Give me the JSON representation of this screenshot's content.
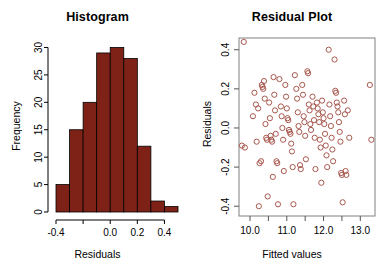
{
  "figure": {
    "background": "#ffffff",
    "panels": [
      "histogram",
      "residual-plot"
    ]
  },
  "histogram": {
    "title": "Histogram",
    "xlabel": "Residuals",
    "ylabel": "Frequency",
    "bar_fill": "#7E2217",
    "bar_border": "#000000",
    "axis_color": "#000000",
    "x_tick_labels": [
      "-0.4",
      "",
      "0.0",
      "0.2",
      "0.4"
    ],
    "x_tick_values": [
      -0.4,
      -0.2,
      0.0,
      0.2,
      0.4
    ],
    "y_tick_labels": [
      "0",
      "5",
      "10",
      "15",
      "20",
      "25",
      "30"
    ],
    "y_tick_values": [
      0,
      5,
      10,
      15,
      20,
      25,
      30
    ]
  },
  "residual_plot": {
    "title": "Residual Plot",
    "xlabel": "Fitted values",
    "ylabel": "Residuals",
    "point_color": "#A8584E",
    "box_color": "#808080",
    "axis_color": "#555555",
    "x_tick_labels": [
      "10.0",
      "",
      "11.0",
      "",
      "12.0",
      "",
      "13.0"
    ],
    "x_tick_values": [
      10.0,
      10.5,
      11.0,
      11.5,
      12.0,
      12.5,
      13.0
    ],
    "y_tick_labels": [
      "-0.4",
      "-0.2",
      "0.0",
      "0.2",
      "0.4"
    ],
    "y_tick_values": [
      -0.4,
      -0.2,
      0.0,
      0.2,
      0.4
    ]
  },
  "chart_data": [
    {
      "type": "bar",
      "id": "histogram",
      "title": "Histogram",
      "xlabel": "Residuals",
      "ylabel": "Frequency",
      "xlim": [
        -0.4,
        0.5
      ],
      "ylim": [
        0,
        31
      ],
      "grid": false,
      "legend": null,
      "bin_width": 0.1,
      "bin_edges": [
        -0.4,
        -0.3,
        -0.2,
        -0.1,
        0.0,
        0.1,
        0.2,
        0.3,
        0.4,
        0.5
      ],
      "categories": [
        "-0.4 to -0.3",
        "-0.3 to -0.2",
        "-0.2 to -0.1",
        "-0.1 to 0.0",
        "0.0 to 0.1",
        "0.1 to 0.2",
        "0.2 to 0.3",
        "0.3 to 0.4",
        "0.4 to 0.5"
      ],
      "values": [
        5,
        15,
        20,
        29,
        30,
        28,
        12,
        2,
        1
      ],
      "color": "#7E2217"
    },
    {
      "type": "scatter",
      "id": "residual-plot",
      "title": "Residual Plot",
      "xlabel": "Fitted values",
      "ylabel": "Residuals",
      "xlim": [
        9.7,
        13.4
      ],
      "ylim": [
        -0.45,
        0.46
      ],
      "grid": false,
      "legend": null,
      "marker": "open-circle",
      "color": "#A8584E",
      "points": [
        [
          9.83,
          0.44
        ],
        [
          9.78,
          -0.09
        ],
        [
          9.86,
          -0.1
        ],
        [
          10.08,
          0.06
        ],
        [
          10.12,
          0.18
        ],
        [
          10.16,
          0.12
        ],
        [
          10.18,
          -0.07
        ],
        [
          10.22,
          0.1
        ],
        [
          10.24,
          -0.4
        ],
        [
          10.26,
          -0.18
        ],
        [
          10.3,
          -0.17
        ],
        [
          10.32,
          0.22
        ],
        [
          10.34,
          0.21
        ],
        [
          10.36,
          0.2
        ],
        [
          10.38,
          0.24
        ],
        [
          10.4,
          0.15
        ],
        [
          10.42,
          0.02
        ],
        [
          10.44,
          -0.05
        ],
        [
          10.46,
          -0.06
        ],
        [
          10.48,
          -0.35
        ],
        [
          10.52,
          0.13
        ],
        [
          10.54,
          0.05
        ],
        [
          10.56,
          -0.04
        ],
        [
          10.58,
          -0.06
        ],
        [
          10.6,
          -0.07
        ],
        [
          10.62,
          -0.25
        ],
        [
          10.64,
          0.26
        ],
        [
          10.66,
          0.17
        ],
        [
          10.68,
          0.09
        ],
        [
          10.7,
          -0.03
        ],
        [
          10.72,
          -0.17
        ],
        [
          10.74,
          -0.18
        ],
        [
          10.76,
          -0.39
        ],
        [
          10.8,
          0.25
        ],
        [
          10.84,
          0.11
        ],
        [
          10.86,
          0.06
        ],
        [
          10.88,
          0.0
        ],
        [
          10.9,
          -0.06
        ],
        [
          10.92,
          -0.22
        ],
        [
          10.96,
          0.22
        ],
        [
          10.98,
          0.16
        ],
        [
          11.0,
          0.1
        ],
        [
          11.02,
          0.05
        ],
        [
          11.04,
          0.04
        ],
        [
          11.06,
          -0.01
        ],
        [
          11.08,
          -0.02
        ],
        [
          11.1,
          -0.03
        ],
        [
          11.12,
          -0.08
        ],
        [
          11.14,
          -0.12
        ],
        [
          11.16,
          -0.2
        ],
        [
          11.18,
          -0.39
        ],
        [
          11.22,
          0.27
        ],
        [
          11.26,
          0.2
        ],
        [
          11.28,
          0.15
        ],
        [
          11.3,
          0.08
        ],
        [
          11.32,
          0.01
        ],
        [
          11.34,
          -0.02
        ],
        [
          11.36,
          -0.19
        ],
        [
          11.38,
          -0.21
        ],
        [
          11.42,
          0.22
        ],
        [
          11.44,
          0.17
        ],
        [
          11.46,
          0.06
        ],
        [
          11.48,
          0.03
        ],
        [
          11.5,
          -0.04
        ],
        [
          11.52,
          -0.16
        ],
        [
          11.56,
          0.29
        ],
        [
          11.58,
          0.28
        ],
        [
          11.6,
          0.12
        ],
        [
          11.62,
          0.09
        ],
        [
          11.64,
          0.02
        ],
        [
          11.66,
          -0.01
        ],
        [
          11.7,
          0.16
        ],
        [
          11.72,
          0.11
        ],
        [
          11.74,
          0.04
        ],
        [
          11.76,
          -0.05
        ],
        [
          11.78,
          -0.21
        ],
        [
          11.82,
          0.13
        ],
        [
          11.84,
          0.1
        ],
        [
          11.86,
          0.07
        ],
        [
          11.88,
          0.03
        ],
        [
          11.9,
          -0.06
        ],
        [
          11.92,
          -0.1
        ],
        [
          11.94,
          -0.28
        ],
        [
          11.96,
          0.14
        ],
        [
          11.98,
          0.08
        ],
        [
          12.0,
          0.05
        ],
        [
          12.02,
          0.02
        ],
        [
          12.04,
          -0.03
        ],
        [
          12.06,
          -0.09
        ],
        [
          12.08,
          -0.14
        ],
        [
          12.1,
          -0.2
        ],
        [
          12.14,
          0.4
        ],
        [
          12.16,
          0.12
        ],
        [
          12.18,
          0.06
        ],
        [
          12.2,
          0.01
        ],
        [
          12.22,
          -0.05
        ],
        [
          12.24,
          -0.11
        ],
        [
          12.26,
          -0.17
        ],
        [
          12.3,
          0.35
        ],
        [
          12.32,
          0.19
        ],
        [
          12.34,
          0.18
        ],
        [
          12.36,
          0.13
        ],
        [
          12.38,
          0.11
        ],
        [
          12.4,
          0.08
        ],
        [
          12.42,
          0.03
        ],
        [
          12.44,
          -0.02
        ],
        [
          12.46,
          -0.07
        ],
        [
          12.48,
          -0.23
        ],
        [
          12.5,
          -0.24
        ],
        [
          12.52,
          -0.38
        ],
        [
          12.56,
          0.14
        ],
        [
          12.58,
          0.07
        ],
        [
          12.6,
          -0.22
        ],
        [
          12.62,
          -0.24
        ],
        [
          12.66,
          0.09
        ],
        [
          12.7,
          -0.05
        ],
        [
          13.26,
          0.22
        ],
        [
          13.3,
          -0.06
        ]
      ]
    }
  ]
}
